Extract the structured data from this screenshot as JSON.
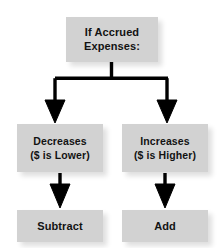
{
  "diagram": {
    "colors": {
      "background": "#ffffff",
      "box_fill": "#d2d2d2",
      "text": "#121212",
      "connector": "#000000"
    },
    "nodes": {
      "root": {
        "line1": "If Accrued",
        "line2": "Expenses:"
      },
      "decreases": {
        "line1": "Decreases",
        "line2": "($ is Lower)"
      },
      "increases": {
        "line1": "Increases",
        "line2": "($ is Higher)"
      },
      "subtract": {
        "line1": "Subtract"
      },
      "add": {
        "line1": "Add"
      }
    },
    "edges": [
      {
        "from": "root",
        "to": "decreases",
        "style": "elbow-arrow"
      },
      {
        "from": "root",
        "to": "increases",
        "style": "elbow-arrow"
      },
      {
        "from": "decreases",
        "to": "subtract",
        "style": "straight-arrow"
      },
      {
        "from": "increases",
        "to": "add",
        "style": "straight-arrow"
      }
    ]
  }
}
